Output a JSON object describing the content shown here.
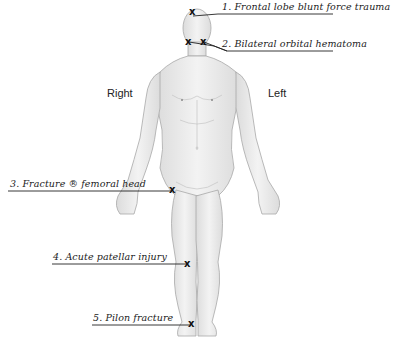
{
  "diagram": {
    "type": "anatomical body chart (anterior view)",
    "orientation_labels": {
      "right": "Right",
      "left": "Left"
    },
    "marker_glyph": "x",
    "annotations": [
      {
        "id": 1,
        "text": "1. Frontal lobe blunt force trauma",
        "location": "forehead"
      },
      {
        "id": 2,
        "text": "2. Bilateral orbital hematoma",
        "location": "both eyes"
      },
      {
        "id": 3,
        "text": "3. Fracture ® femoral head",
        "location": "right hip"
      },
      {
        "id": 4,
        "text": "4. Acute patellar injury",
        "location": "right knee"
      },
      {
        "id": 5,
        "text": "5. Pilon fracture",
        "location": "right ankle"
      }
    ],
    "colors": {
      "skin": "#ececec",
      "outline": "#9a9a9a",
      "ink": "#222222"
    }
  }
}
